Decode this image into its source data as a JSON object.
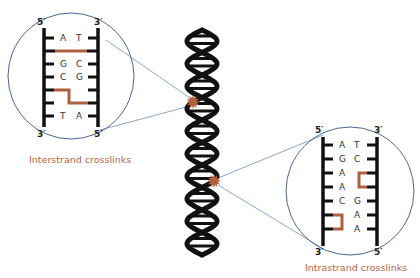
{
  "colors": {
    "strand": "#111111",
    "crosslink": "#b0603f",
    "circle": "#4a6690",
    "connector": "#8fa8c4",
    "star": "#b2603c",
    "caption": "#b5654a"
  },
  "helix": {
    "label": "DNA double helix",
    "damage_sites": [
      {
        "id": "upper",
        "cx": 193,
        "cy": 102,
        "links_to": "interstrand"
      },
      {
        "id": "lower",
        "cx": 214,
        "cy": 181,
        "links_to": "intrastrand"
      }
    ]
  },
  "interstrand": {
    "caption": "Interstrand crosslinks",
    "top_left": "5′",
    "top_right": "3′",
    "bottom_left": "3′",
    "bottom_right": "5′",
    "pairs": [
      {
        "left": "A",
        "right": "T"
      },
      {
        "left": "",
        "right": ""
      },
      {
        "left": "G",
        "right": "C"
      },
      {
        "left": "C",
        "right": "G"
      },
      {
        "left": "",
        "right": ""
      },
      {
        "left": "",
        "right": ""
      },
      {
        "left": "T",
        "right": "A"
      }
    ]
  },
  "intrastrand": {
    "caption": "Intrastrand crosslinks",
    "top_left": "5′",
    "top_right": "3′",
    "bottom_left": "3′",
    "bottom_right": "5′",
    "pairs": [
      {
        "left": "A",
        "right": "T"
      },
      {
        "left": "G",
        "right": "C"
      },
      {
        "left": "A",
        "right": ""
      },
      {
        "left": "A",
        "right": ""
      },
      {
        "left": "C",
        "right": "G"
      },
      {
        "left": "",
        "right": "A"
      },
      {
        "left": "",
        "right": "A"
      }
    ]
  }
}
